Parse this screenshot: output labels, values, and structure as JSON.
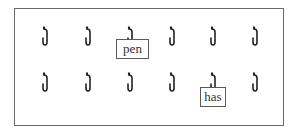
{
  "diagram": {
    "rows": [
      {
        "hooks": 6,
        "y": 26
      },
      {
        "hooks": 6,
        "y": 72
      }
    ],
    "hook_x": [
      40,
      83,
      125,
      167,
      208,
      250
    ],
    "cards": [
      {
        "label": "pen",
        "row": 0,
        "col": 2
      },
      {
        "label": "has",
        "row": 1,
        "col": 4
      }
    ],
    "border_color": "#6a6a6a",
    "hook_color": "#222222"
  }
}
